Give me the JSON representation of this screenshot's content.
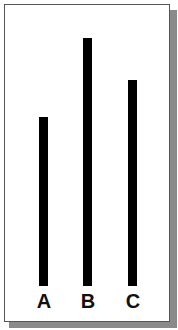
{
  "figure": {
    "bar_color": "#000000",
    "background_color": "#ffffff",
    "border_color": "#555555",
    "shadow_color": "#8a8a8a"
  },
  "lines": [
    {
      "label": "A",
      "x": 39,
      "top": 117,
      "bottom": 286,
      "relative_length": 169
    },
    {
      "label": "B",
      "x": 83,
      "top": 38,
      "bottom": 286,
      "relative_length": 248
    },
    {
      "label": "C",
      "x": 128,
      "top": 80,
      "bottom": 286,
      "relative_length": 206
    }
  ]
}
